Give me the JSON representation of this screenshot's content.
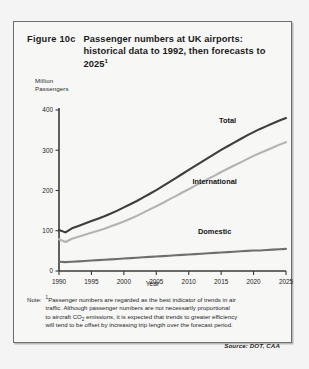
{
  "figure": {
    "number": "Figure 10c",
    "title_line1": "Passenger numbers at UK airports:",
    "title_line2": "historical data to 1992, then forecasts to",
    "title_line3": "2025",
    "title_footnote_marker": "1"
  },
  "note": {
    "label": "Note:",
    "marker": "1",
    "line1_a": "Passenger numbers are regarded as the best indicator of trends in air",
    "line2": "traffic. Although passenger numbers are not necessarily proportional",
    "line3_a": "to aircraft CO",
    "line3_sub": "2",
    "line3_b": " emissions, it is expected that trends to greater efficiency",
    "line4": "will tend to be offset by increasing trip length over the forecast period."
  },
  "source": "Source: DOT, CAA",
  "colors": {
    "total": "#3d3d3d",
    "international": "#b3b3b3",
    "domestic": "#6f6f6f",
    "axis": "#3a3a3a",
    "border": "#6d6d6d",
    "background": "#f7f7f6"
  },
  "chart_data": {
    "type": "line",
    "title": "Passenger numbers at UK airports: historical data to 1992, then forecasts to 2025",
    "xlabel": "Year",
    "ylabel": "Million Passengers",
    "ylabel_line1": "Million",
    "ylabel_line2": "Passengers",
    "xlim": [
      1990,
      2025
    ],
    "ylim": [
      0,
      400
    ],
    "yticks": [
      0,
      100,
      200,
      300,
      400
    ],
    "ytick_labels": [
      "0",
      "100",
      "200",
      "300",
      "400"
    ],
    "xticks": [
      1990,
      1995,
      2000,
      2005,
      2010,
      2015,
      2020,
      2025
    ],
    "xtick_labels": [
      "1990",
      "1995",
      "2000",
      "2005",
      "2010",
      "2015",
      "2020",
      "2025"
    ],
    "grid": false,
    "legend": "inline-labels",
    "x": [
      1990,
      1991,
      1992,
      1993,
      1994,
      1995,
      1996,
      1997,
      1998,
      1999,
      2000,
      2001,
      2002,
      2003,
      2004,
      2005,
      2006,
      2007,
      2008,
      2009,
      2010,
      2011,
      2012,
      2013,
      2014,
      2015,
      2016,
      2017,
      2018,
      2019,
      2020,
      2021,
      2022,
      2023,
      2024,
      2025
    ],
    "series": [
      {
        "name": "Total",
        "color": "#3d3d3d",
        "label_x": 2016,
        "label_y": 368,
        "values": [
          102,
          96,
          106,
          112,
          118,
          124,
          130,
          136,
          143,
          150,
          158,
          166,
          174,
          183,
          192,
          201,
          211,
          221,
          231,
          241,
          251,
          261,
          271,
          281,
          291,
          301,
          310,
          319,
          328,
          337,
          345,
          353,
          360,
          367,
          374,
          380
        ]
      },
      {
        "name": "International",
        "color": "#b3b3b3",
        "label_x": 2014,
        "label_y": 215,
        "values": [
          79,
          72,
          80,
          85,
          90,
          95,
          100,
          105,
          111,
          117,
          123,
          130,
          137,
          145,
          153,
          161,
          169,
          178,
          186,
          195,
          203,
          212,
          220,
          229,
          237,
          246,
          254,
          262,
          270,
          278,
          286,
          293,
          300,
          307,
          314,
          320
        ]
      },
      {
        "name": "Domestic",
        "color": "#6f6f6f",
        "label_x": 2014,
        "label_y": 92,
        "values": [
          23,
          22,
          23,
          24,
          25,
          26,
          27,
          28,
          29,
          30,
          31,
          32,
          33,
          34,
          35,
          36,
          37,
          38,
          39,
          40,
          41,
          42,
          43,
          44,
          45,
          46,
          47,
          48,
          49,
          50,
          51,
          51,
          52,
          53,
          54,
          55
        ]
      }
    ]
  }
}
